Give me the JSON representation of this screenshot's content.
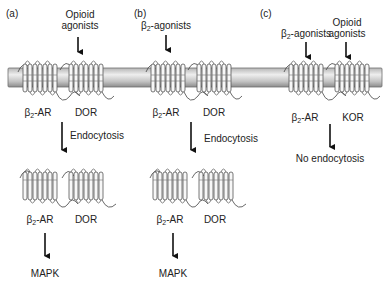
{
  "panels": [
    {
      "label": "(a)",
      "stimulus": "Opioid\nagonists",
      "stimulus_line1": "Opioid",
      "stimulus_line2": "agonists",
      "receptors": [
        "β2-AR",
        "DOR"
      ],
      "receptor1_base": "β",
      "receptor1_sub": "2",
      "receptor1_rest": "-AR",
      "receptor2": "DOR",
      "process": "Endocytosis",
      "internal_receptor1_base": "β",
      "internal_receptor1_sub": "2",
      "internal_receptor1_rest": "-AR",
      "internal_receptor2": "DOR",
      "outcome": "MAPK"
    },
    {
      "label": "(b)",
      "stimulus_base": "β",
      "stimulus_sub": "2",
      "stimulus_rest": "-agonists",
      "receptors": [
        "β2-AR",
        "DOR"
      ],
      "receptor1_base": "β",
      "receptor1_sub": "2",
      "receptor1_rest": "-AR",
      "receptor2": "DOR",
      "process": "Endocytosis",
      "internal_receptor1_base": "β",
      "internal_receptor1_sub": "2",
      "internal_receptor1_rest": "-AR",
      "internal_receptor2": "DOR",
      "outcome": "MAPK"
    },
    {
      "label": "(c)",
      "stimulus1_base": "β",
      "stimulus1_sub": "2",
      "stimulus1_rest": "-agonists",
      "stimulus2_line1": "Opioid",
      "stimulus2_line2": "agonists",
      "receptors": [
        "β2-AR",
        "KOR"
      ],
      "receptor1_base": "β",
      "receptor1_sub": "2",
      "receptor1_rest": "-AR",
      "receptor2": "KOR",
      "outcome": "No endocytosis"
    }
  ],
  "colors": {
    "membrane_light": "#e6e6e6",
    "membrane_dark": "#8c8c8c",
    "membrane_stroke": "#6e6e6e",
    "receptor_stroke": "#555555",
    "receptor_fill": "#f4f4f4",
    "arrow": "#111111"
  }
}
